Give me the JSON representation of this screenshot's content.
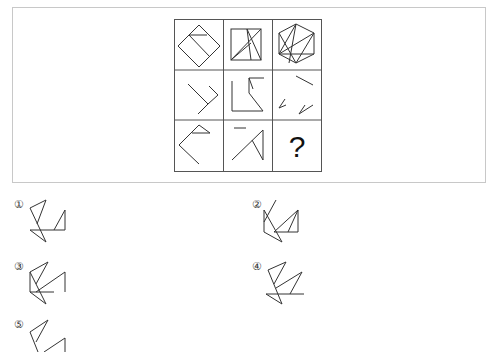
{
  "question": {
    "grid": {
      "rows": 3,
      "cols": 3,
      "cells": [
        {
          "row": 1,
          "col": 1,
          "description": "diamond with inner line"
        },
        {
          "row": 1,
          "col": 2,
          "description": "square with diagonals"
        },
        {
          "row": 1,
          "col": 3,
          "description": "hexagon with inner lines"
        },
        {
          "row": 2,
          "col": 1,
          "description": "angled strokes"
        },
        {
          "row": 2,
          "col": 2,
          "description": "L shape with angled lines"
        },
        {
          "row": 2,
          "col": 3,
          "description": "scattered strokes"
        },
        {
          "row": 3,
          "col": 1,
          "description": "angle with flag triangle"
        },
        {
          "row": 3,
          "col": 2,
          "description": "short dash and triangle strokes"
        },
        {
          "row": 3,
          "col": 3,
          "description": "unknown",
          "label": "?"
        }
      ]
    }
  },
  "options": [
    {
      "label": "①"
    },
    {
      "label": "②"
    },
    {
      "label": "③"
    },
    {
      "label": "④"
    },
    {
      "label": "⑤"
    }
  ]
}
